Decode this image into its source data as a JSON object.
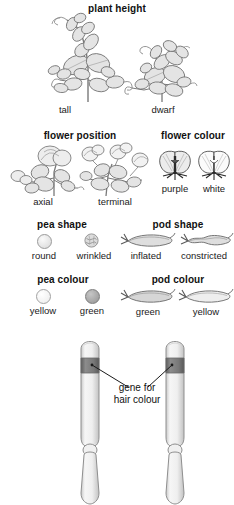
{
  "figure": {
    "title_visible": false,
    "background": "#ffffff",
    "ink": "#1a1a1a"
  },
  "sections": [
    {
      "key": "plant_height",
      "heading": "plant height",
      "items": [
        {
          "label": "tall",
          "icon": "pea-plant-tall-icon"
        },
        {
          "label": "dwarf",
          "icon": "pea-plant-dwarf-icon"
        }
      ]
    },
    {
      "key": "flower_position",
      "heading": "flower position",
      "items": [
        {
          "label": "axial",
          "icon": "flower-axial-icon"
        },
        {
          "label": "terminal",
          "icon": "flower-terminal-icon"
        }
      ]
    },
    {
      "key": "flower_colour",
      "heading": "flower colour",
      "items": [
        {
          "label": "purple",
          "icon": "flower-purple-icon",
          "colour": "#6b6b6b"
        },
        {
          "label": "white",
          "icon": "flower-white-icon",
          "colour": "#ffffff"
        }
      ]
    },
    {
      "key": "pea_shape",
      "heading": "pea shape",
      "items": [
        {
          "label": "round",
          "icon": "pea-round-icon",
          "colour": "#e8e8e8"
        },
        {
          "label": "wrinkled",
          "icon": "pea-wrinkled-icon",
          "colour": "#d9d9d9"
        }
      ]
    },
    {
      "key": "pod_shape",
      "heading": "pod shape",
      "items": [
        {
          "label": "inflated",
          "icon": "pod-inflated-icon"
        },
        {
          "label": "constricted",
          "icon": "pod-constricted-icon"
        }
      ]
    },
    {
      "key": "pea_colour",
      "heading": "pea colour",
      "items": [
        {
          "label": "yellow",
          "icon": "pea-yellow-icon",
          "colour": "#f0f0f0"
        },
        {
          "label": "green",
          "icon": "pea-green-icon",
          "colour": "#a6a6a6"
        }
      ]
    },
    {
      "key": "pod_colour",
      "heading": "pod colour",
      "items": [
        {
          "label": "green",
          "icon": "pod-green-icon"
        },
        {
          "label": "yellow",
          "icon": "pod-yellow-icon"
        }
      ]
    }
  ],
  "chromosome_panel": {
    "annotation_line1": "gene for",
    "annotation_line2": "hair colour",
    "gene_band_colour": "#777777",
    "chromosome_fill": "#f2f2f2",
    "chromosome_outline": "#8c8c8c",
    "chromosomes": [
      {
        "name": "chromosome-left"
      },
      {
        "name": "chromosome-right"
      }
    ]
  }
}
